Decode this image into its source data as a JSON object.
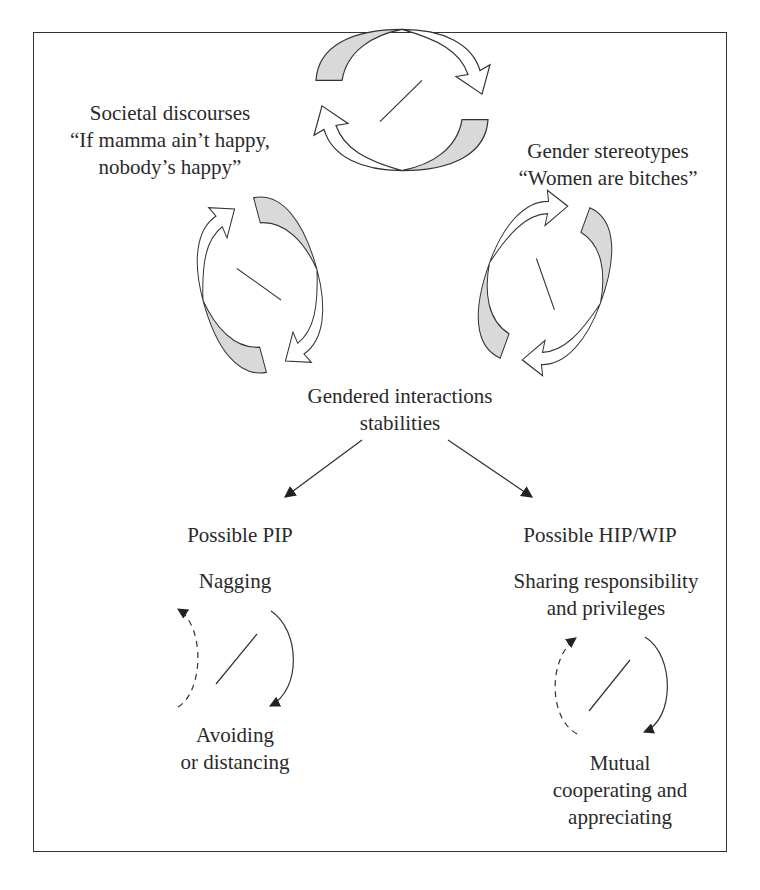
{
  "colors": {
    "shade": "#d9d9d9",
    "stroke": "#333333",
    "background": "#ffffff"
  },
  "labels": {
    "societal_title": "Societal discourses",
    "societal_quote_1": "“If mamma ain’t happy,",
    "societal_quote_2": "nobody’s happy”",
    "gender_title": "Gender stereotypes",
    "gender_quote": "“Women are bitches”",
    "gendered_1": "Gendered interactions",
    "gendered_2": "stabilities",
    "pip_title": "Possible PIP",
    "pip_top": "Nagging",
    "pip_bottom_1": "Avoiding",
    "pip_bottom_2": "or distancing",
    "hip_title": "Possible HIP/WIP",
    "hip_top_1": "Sharing responsibility",
    "hip_top_2": "and privileges",
    "hip_bottom_1": "Mutual",
    "hip_bottom_2": "cooperating and",
    "hip_bottom_3": "appreciating"
  },
  "icons": {
    "cycle_top": "double-circular-arrow-icon",
    "cycle_left": "double-circular-arrow-icon",
    "cycle_right": "double-circular-arrow-icon",
    "cycle_pip": "simple-cycle-arrow-icon",
    "cycle_hip": "simple-cycle-arrow-icon"
  }
}
